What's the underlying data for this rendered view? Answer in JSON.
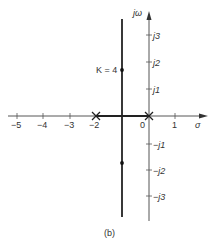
{
  "figure": {
    "caption": "(b)",
    "real_axis": {
      "label": "σ",
      "ticks": [
        {
          "value": -5,
          "label": "−5"
        },
        {
          "value": -4,
          "label": "−4"
        },
        {
          "value": -3,
          "label": "−3"
        },
        {
          "value": -2,
          "label": "−2"
        },
        {
          "value": 0,
          "label": "0"
        },
        {
          "value": 1,
          "label": "1"
        }
      ]
    },
    "imag_axis": {
      "label": "jω",
      "ticks": [
        {
          "value": 3,
          "label": "j3"
        },
        {
          "value": 2,
          "label": "j2"
        },
        {
          "value": 1,
          "label": "j1"
        },
        {
          "value": -1,
          "label": "−j1"
        },
        {
          "value": -2,
          "label": "−j2"
        },
        {
          "value": -3,
          "label": "−j3"
        }
      ]
    },
    "poles": [
      {
        "re": -2,
        "im": 0,
        "marker": "×"
      },
      {
        "re": 0,
        "im": 0,
        "marker": "×"
      }
    ],
    "root_locus": {
      "real_segment": {
        "from": -2,
        "to": 0
      },
      "vertical_branch": {
        "re": -1,
        "im_top": 3.6,
        "im_bottom": -3.8
      }
    },
    "annotations": [
      {
        "text": "K = 4",
        "re": -1,
        "im": 1.7
      },
      {
        "text": "",
        "re": -1,
        "im": -1.7
      }
    ]
  }
}
